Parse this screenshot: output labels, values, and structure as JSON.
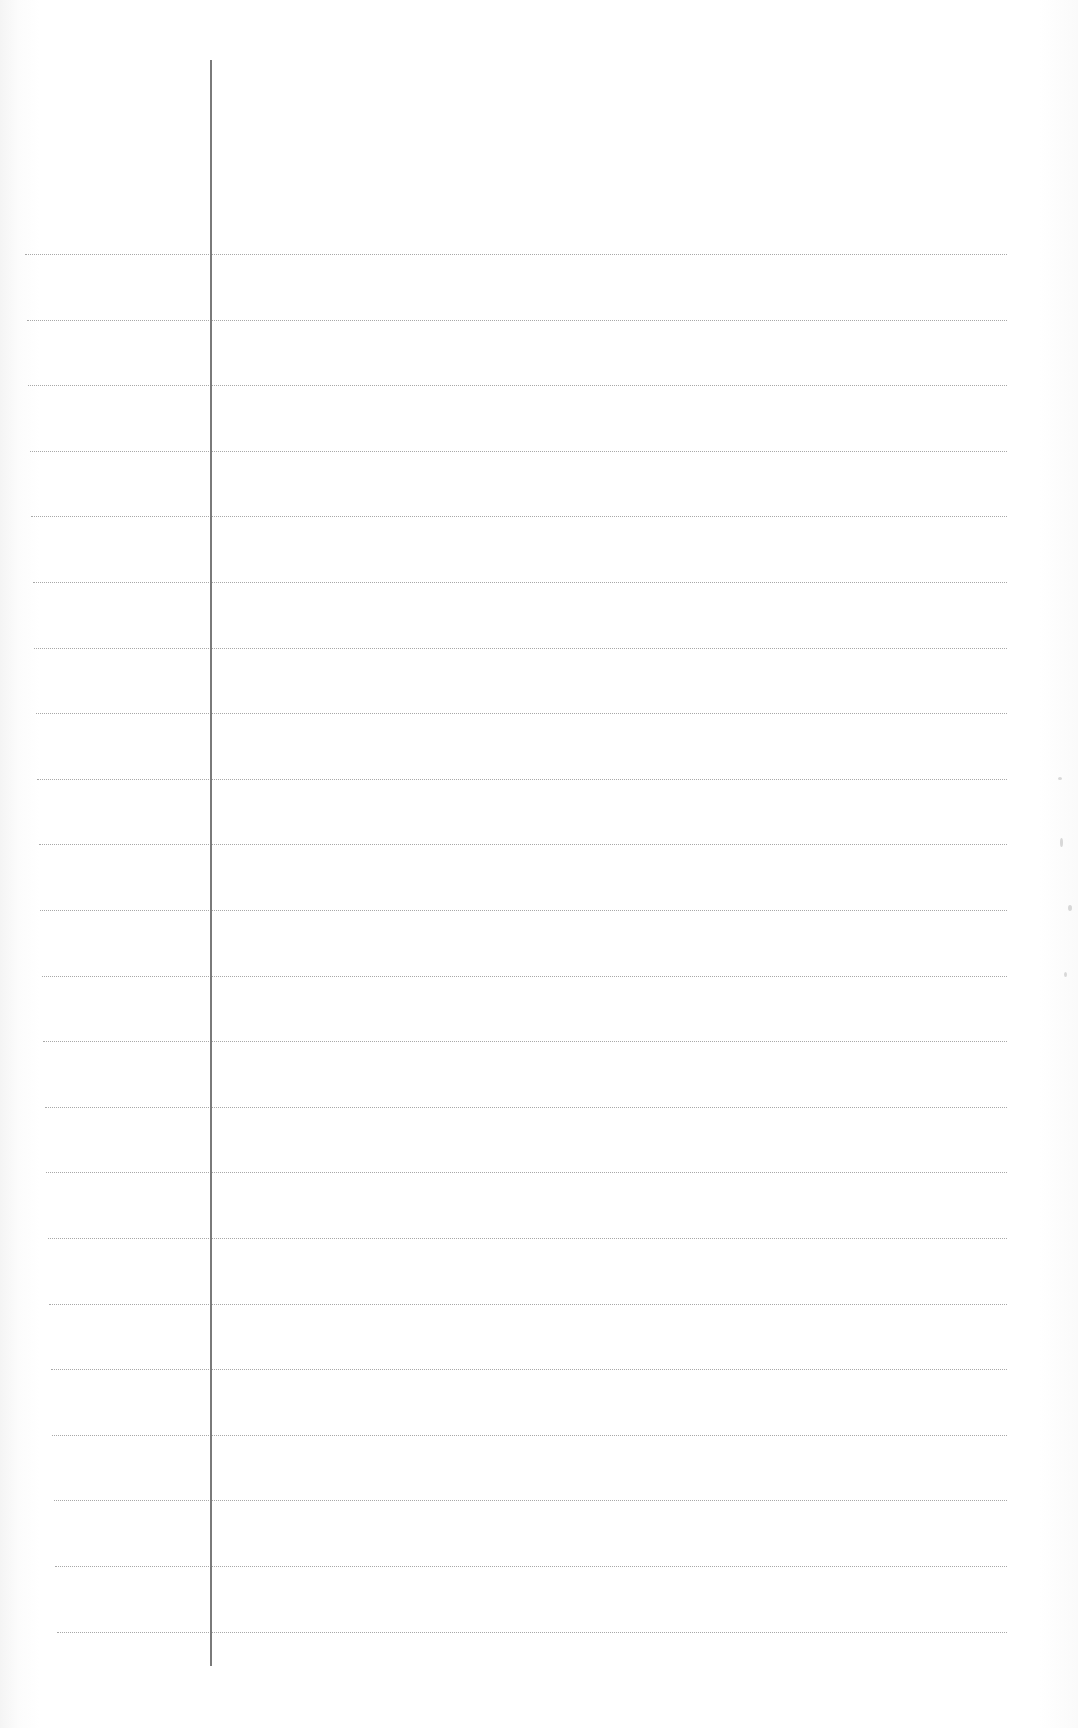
{
  "page": {
    "type": "ruled-notebook-paper",
    "background_color": "#ffffff",
    "rule_color": "#9a9a9a",
    "margin_line_color": "#7a7a7a",
    "rule_count": 22,
    "rule_spacing_px": 65.6,
    "first_rule_y": 254,
    "margin_line_x": 210,
    "text_content": ""
  }
}
